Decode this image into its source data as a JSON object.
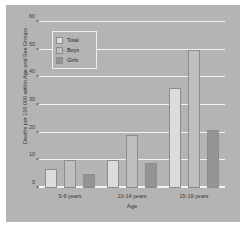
{
  "chart_data": {
    "type": "bar",
    "title": "",
    "xlabel": "Age",
    "ylabel": "Deaths per 100 000 within Age and Sex Groups",
    "categories": [
      "5-9 years",
      "10-14 years",
      "15-19 years"
    ],
    "series": [
      {
        "name": "Total",
        "color": "#dcdcdc",
        "values": [
          7,
          10,
          36
        ]
      },
      {
        "name": "Boys",
        "color": "#bfbfbf",
        "values": [
          10,
          19,
          50
        ]
      },
      {
        "name": "Girls",
        "color": "#949494",
        "values": [
          5,
          9,
          21
        ]
      }
    ],
    "ylim": [
      0,
      60
    ],
    "yticks": [
      0,
      10,
      20,
      30,
      40,
      50,
      60
    ],
    "grid": true,
    "legend_position": "top-left",
    "background_color": "#b4b4b4",
    "gridline_color": "#f2f2f2"
  }
}
